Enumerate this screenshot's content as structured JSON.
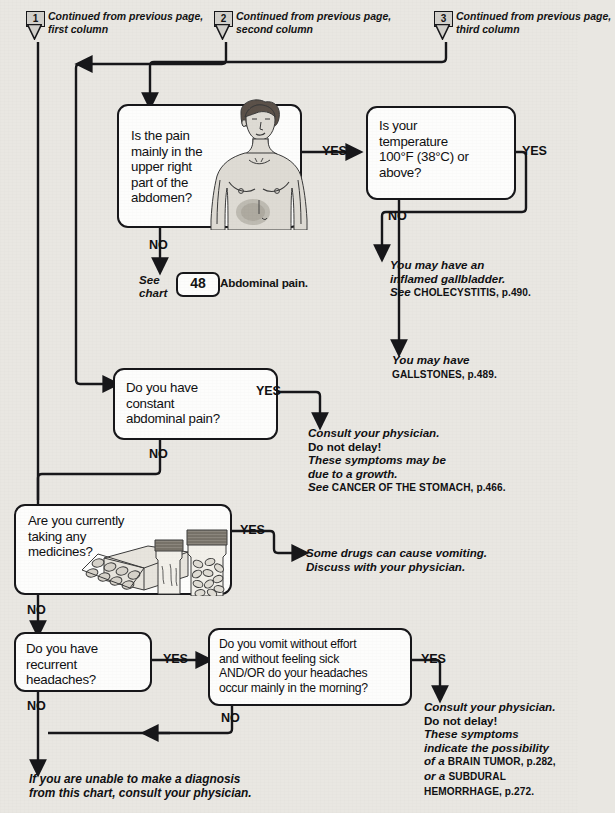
{
  "page": {
    "background_color": "#e9e7e2",
    "ink_color": "#17171a"
  },
  "connectors": [
    {
      "number": "1",
      "text": "Continued from previous page, first column"
    },
    {
      "number": "2",
      "text": "Continued from previous page, second column"
    },
    {
      "number": "3",
      "text": "Continued from previous page, third column"
    }
  ],
  "questions": [
    {
      "id": "q_upper_right_pain",
      "text": "Is the pain mainly in the upper right part of the abdomen?",
      "yes_label": "YES",
      "no_label": "NO",
      "illustration": "torso-abdomen-illustration"
    },
    {
      "id": "q_temperature",
      "text": "Is your temperature 100°F (38°C) or above?",
      "yes_label": "YES",
      "no_label": "NO"
    },
    {
      "id": "q_constant_pain",
      "text": "Do you have constant abdominal pain?",
      "yes_label": "YES",
      "no_label": "NO"
    },
    {
      "id": "q_medicines",
      "text": "Are you currently taking any medicines?",
      "yes_label": "YES",
      "no_label": "NO",
      "illustration": "medicine-bottles-illustration"
    },
    {
      "id": "q_recurrent_headaches",
      "text": "Do you have recurrent headaches?",
      "yes_label": "YES",
      "no_label": "NO"
    },
    {
      "id": "q_vomit_without_effort",
      "text": "Do you vomit without effort and without feeling sick AND/OR do your headaches occur mainly in the morning?",
      "yes_label": "YES",
      "no_label": "NO"
    }
  ],
  "see_chart": {
    "see_label": "See",
    "chart_label": "chart",
    "number": "48",
    "name": "Abdominal pain."
  },
  "outcomes": [
    {
      "id": "outcome_cholecystitis",
      "lines": [
        {
          "text": "You may have an",
          "style": "italic"
        },
        {
          "text": "inflamed gallbladder.",
          "style": "italic"
        },
        {
          "text": "See ",
          "style": "italic",
          "smallcaps": "CHOLECYSTITIS, p.490."
        }
      ]
    },
    {
      "id": "outcome_gallstones",
      "lines": [
        {
          "text": "You may have",
          "style": "italic"
        },
        {
          "text": "",
          "style": "italic",
          "smallcaps": "GALLSTONES, p.489."
        }
      ]
    },
    {
      "id": "outcome_cancer_stomach",
      "lines": [
        {
          "text": "Consult your physician.",
          "style": "italic"
        },
        {
          "text": "Do not delay!",
          "style": "bold"
        },
        {
          "text": "These symptoms may be",
          "style": "italic"
        },
        {
          "text": "due to a growth.",
          "style": "italic"
        },
        {
          "text": "See ",
          "style": "italic",
          "smallcaps": "CANCER OF THE STOMACH, p.466."
        }
      ]
    },
    {
      "id": "outcome_drugs_vomiting",
      "lines": [
        {
          "text": "Some drugs can cause vomiting.",
          "style": "italic"
        },
        {
          "text": "Discuss with your physician.",
          "style": "italic"
        }
      ]
    },
    {
      "id": "outcome_brain_tumor",
      "lines": [
        {
          "text": "Consult your physician.",
          "style": "italic"
        },
        {
          "text": "Do not delay!",
          "style": "bold"
        },
        {
          "text": "These symptoms",
          "style": "italic"
        },
        {
          "text": "indicate the possibility",
          "style": "italic"
        },
        {
          "text": "of a ",
          "style": "italic",
          "smallcaps": "BRAIN TUMOR, p.282,"
        },
        {
          "text": "or a ",
          "style": "italic",
          "smallcaps": "SUBDURAL"
        },
        {
          "text": "",
          "style": "italic",
          "smallcaps": "HEMORRHAGE, p.272."
        }
      ]
    }
  ],
  "final_note": {
    "line1": "If you are unable to make a diagnosis",
    "line2": "from this chart, consult your physician."
  },
  "text_fragments": {
    "q1": "Is the pain\nmainly in the\nupper right\npart of the\nabdomen?",
    "q2": "Is your\ntemperature\n100°F (38°C) or\nabove?",
    "q3": "Do you have\nconstant\nabdominal pain?",
    "q4": "Are you currently\ntaking any\nmedicines?",
    "q5": "Do you have\nrecurrent\nheadaches?",
    "q6": "Do you vomit without effort\nand without feeling sick\nAND/OR do your headaches\noccur mainly in the morning?"
  }
}
